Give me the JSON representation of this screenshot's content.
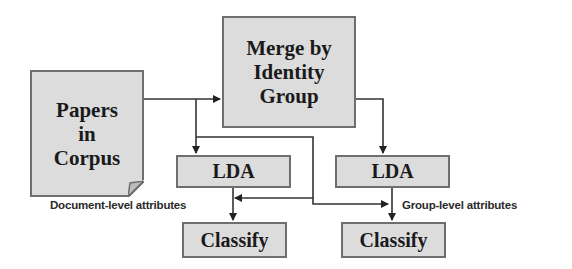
{
  "diagram": {
    "nodes": {
      "papers": {
        "line1": "Papers",
        "line2": "in",
        "line3": "Corpus",
        "shape": "document-with-folded-corner"
      },
      "merge": {
        "line1": "Merge by",
        "line2": "Identity",
        "line3": "Group"
      },
      "lda_left": {
        "label": "LDA"
      },
      "lda_right": {
        "label": "LDA"
      },
      "classify_left": {
        "label": "Classify"
      },
      "classify_right": {
        "label": "Classify"
      }
    },
    "annotations": {
      "document_level": "Document-level attributes",
      "group_level": "Group-level attributes"
    },
    "edges": [
      {
        "from": "papers",
        "to": "merge"
      },
      {
        "from": "papers",
        "to": "lda_left"
      },
      {
        "from": "merge",
        "to": "lda_right"
      },
      {
        "from": "lda_left",
        "to": "classify_left"
      },
      {
        "from": "lda_left",
        "to": "classify_right"
      },
      {
        "from": "lda_right",
        "to": "classify_right"
      },
      {
        "from": "lda_right",
        "to": "classify_left"
      }
    ],
    "colors": {
      "box_fill": "#dcdcdc",
      "box_border": "#6e6e6e",
      "line": "#333333",
      "text": "#1a1a1a"
    }
  }
}
